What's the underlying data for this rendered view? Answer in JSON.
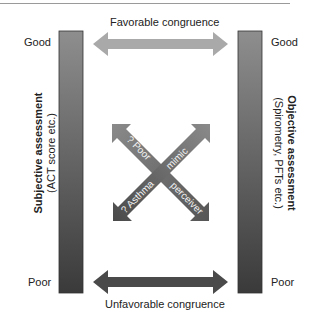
{
  "left_axis": {
    "title": "Subjective assessment",
    "subtitle": "(ACT score etc.)",
    "top_label": "Good",
    "bottom_label": "Poor"
  },
  "right_axis": {
    "title": "Objective assessment",
    "subtitle": "(Spirometry, PFTs etc.)",
    "top_label": "Good",
    "bottom_label": "Poor"
  },
  "top_arrow": {
    "label": "Favorable congruence",
    "color": "#a8a8a8"
  },
  "bottom_arrow": {
    "label": "Unfavorable congruence",
    "color": "#4a4a4a"
  },
  "cross_arrows": {
    "poor_perceiver": {
      "label_start": "? Poor",
      "label_end": "perceiver"
    },
    "asthma_mimic": {
      "label_start": "? Asthma",
      "label_end": "mimic"
    }
  },
  "colors": {
    "bar_top": "#8c8c8c",
    "bar_bottom": "#3c3c3c"
  }
}
